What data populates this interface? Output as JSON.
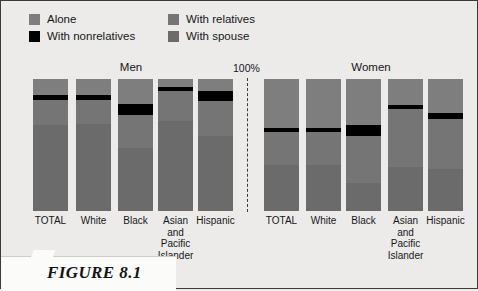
{
  "figure": {
    "caption": "FIGURE 8.1",
    "axis_max_label": "100%",
    "page_bg": "#ecebe9"
  },
  "legend": {
    "items": [
      {
        "label": "Alone",
        "color": "#7e7e7e",
        "key": "alone"
      },
      {
        "label": "With nonrelatives",
        "color": "#000000",
        "key": "nonrelatives"
      },
      {
        "label": "With relatives",
        "color": "#757575",
        "key": "relatives"
      },
      {
        "label": "With spouse",
        "color": "#6b6b6b",
        "key": "spouse"
      }
    ]
  },
  "groups": [
    {
      "name": "men",
      "title": "Men"
    },
    {
      "name": "women",
      "title": "Women"
    }
  ],
  "chart_data": {
    "type": "bar",
    "title": "",
    "subtitle": "",
    "xlabel": "",
    "ylabel": "",
    "ylim": [
      0,
      100
    ],
    "grid": false,
    "legend_position": "top-left",
    "stacked": true,
    "stack_order": [
      "Alone",
      "With nonrelatives",
      "With relatives",
      "With spouse"
    ],
    "series": [
      {
        "name": "Alone",
        "color": "#7e7e7e"
      },
      {
        "name": "With nonrelatives",
        "color": "#000000"
      },
      {
        "name": "With relatives",
        "color": "#757575"
      },
      {
        "name": "With spouse",
        "color": "#6b6b6b"
      }
    ],
    "panels": [
      {
        "group": "Men",
        "categories": [
          "TOTAL",
          "White",
          "Black",
          "Asian and Pacific Islander",
          "Hispanic"
        ],
        "bars": [
          {
            "category": "TOTAL",
            "values": [
              12,
              4,
              19,
              65
            ]
          },
          {
            "category": "White",
            "values": [
              12,
              4,
              18,
              66
            ]
          },
          {
            "category": "Black",
            "values": [
              19,
              8,
              25,
              48
            ]
          },
          {
            "category": "Asian and Pacific Islander",
            "values": [
              6,
              3,
              23,
              68
            ]
          },
          {
            "category": "Hispanic",
            "values": [
              9,
              8,
              26,
              57
            ]
          }
        ]
      },
      {
        "group": "Women",
        "categories": [
          "TOTAL",
          "White",
          "Black",
          "Asian and Pacific Islander",
          "Hispanic"
        ],
        "bars": [
          {
            "category": "TOTAL",
            "values": [
              37,
              3,
              25,
              35
            ]
          },
          {
            "category": "White",
            "values": [
              37,
              3,
              25,
              35
            ]
          },
          {
            "category": "Black",
            "values": [
              35,
              8,
              36,
              21
            ]
          },
          {
            "category": "Asian and Pacific Islander",
            "values": [
              20,
              3,
              44,
              33
            ]
          },
          {
            "category": "Hispanic",
            "values": [
              26,
              4,
              38,
              32
            ]
          }
        ]
      }
    ]
  },
  "x_labels": {
    "men": [
      "TOTAL",
      "White",
      "Black",
      "Asian\nand\nPacific\nIslander",
      "Hispanic"
    ],
    "women": [
      "TOTAL",
      "White",
      "Black",
      "Asian\nand\nPacific\nIslander",
      "Hispanic"
    ]
  }
}
